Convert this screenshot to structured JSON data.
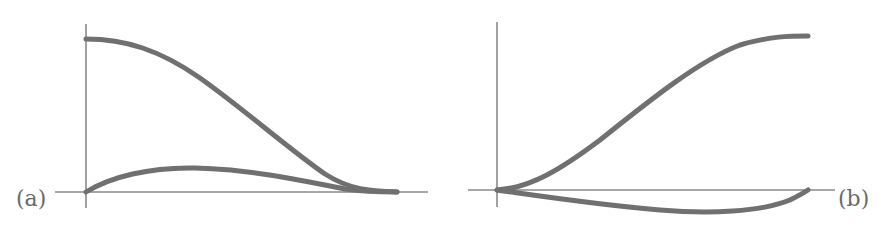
{
  "figure": {
    "panels": [
      {
        "id": "a",
        "label": "(a)",
        "label_position": "bottom-left",
        "curves": [
          {
            "name": "upper-curve",
            "description": "starts at maximum on y-axis, decreases smoothly (S-shaped) to zero at right end"
          },
          {
            "name": "lower-curve",
            "description": "starts at zero, rises to small hump, returns to zero at right end"
          }
        ]
      },
      {
        "id": "b",
        "label": "(b)",
        "label_position": "bottom-right",
        "curves": [
          {
            "name": "upper-curve",
            "description": "starts at zero, increases smoothly (S-shaped) to maximum at right end"
          },
          {
            "name": "lower-curve",
            "description": "starts at zero, dips below axis to a minimum, returns to zero at right end"
          }
        ]
      }
    ],
    "colors": {
      "curve": "#707070",
      "axis": "#8a8a8a",
      "label": "#6a6a6a",
      "background": "#ffffff"
    }
  }
}
